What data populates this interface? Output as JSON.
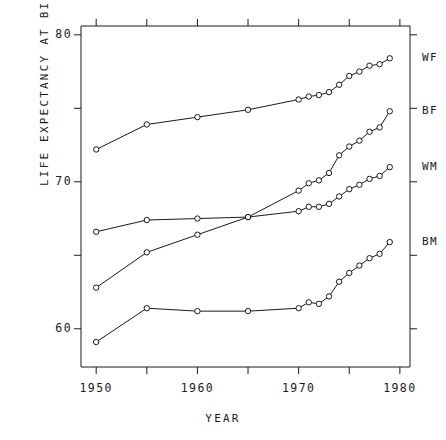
{
  "chart_data": {
    "type": "line",
    "title": "",
    "xlabel": "YEAR",
    "ylabel": "LIFE EXPECTANCY AT BIRTH (YEARS)",
    "xlim": [
      1948.5,
      1981.0
    ],
    "ylim": [
      57.4,
      80.6
    ],
    "grid": false,
    "legend_position": "right-of-axes-inline",
    "x_major_ticks": [
      1950,
      1960,
      1970,
      1980
    ],
    "x_minor_ticks": [
      1955,
      1965,
      1975
    ],
    "x_tick_labels": [
      "1950",
      "1960",
      "1970",
      "1980"
    ],
    "y_major_ticks": [
      60,
      70,
      80
    ],
    "y_minor_ticks": [
      65,
      75
    ],
    "y_tick_labels": [
      "60",
      "70",
      "80"
    ],
    "marker": "open-circle",
    "series": [
      {
        "name": "WF",
        "label": "WF",
        "color": "#1a1a1a",
        "points": [
          [
            1950,
            72.2
          ],
          [
            1955,
            73.9
          ],
          [
            1960,
            74.4
          ],
          [
            1965,
            74.9
          ],
          [
            1970,
            75.6
          ],
          [
            1971,
            75.8
          ],
          [
            1972,
            75.9
          ],
          [
            1973,
            76.1
          ],
          [
            1974,
            76.6
          ],
          [
            1975,
            77.2
          ],
          [
            1976,
            77.5
          ],
          [
            1977,
            77.9
          ],
          [
            1978,
            78.0
          ],
          [
            1979,
            78.4
          ]
        ]
      },
      {
        "name": "BF",
        "label": "BF",
        "color": "#1a1a1a",
        "points": [
          [
            1950,
            62.8
          ],
          [
            1955,
            65.2
          ],
          [
            1960,
            66.4
          ],
          [
            1965,
            67.6
          ],
          [
            1970,
            69.4
          ],
          [
            1971,
            69.9
          ],
          [
            1972,
            70.1
          ],
          [
            1973,
            70.6
          ],
          [
            1974,
            71.8
          ],
          [
            1975,
            72.4
          ],
          [
            1976,
            72.8
          ],
          [
            1977,
            73.4
          ],
          [
            1978,
            73.7
          ],
          [
            1979,
            74.8
          ]
        ]
      },
      {
        "name": "WM",
        "label": "WM",
        "color": "#1a1a1a",
        "points": [
          [
            1950,
            66.6
          ],
          [
            1955,
            67.4
          ],
          [
            1960,
            67.5
          ],
          [
            1965,
            67.6
          ],
          [
            1970,
            68.0
          ],
          [
            1971,
            68.3
          ],
          [
            1972,
            68.3
          ],
          [
            1973,
            68.5
          ],
          [
            1974,
            69.0
          ],
          [
            1975,
            69.5
          ],
          [
            1976,
            69.8
          ],
          [
            1977,
            70.2
          ],
          [
            1978,
            70.4
          ],
          [
            1979,
            71.0
          ]
        ]
      },
      {
        "name": "BM",
        "label": "BM",
        "color": "#1a1a1a",
        "points": [
          [
            1950,
            59.1
          ],
          [
            1955,
            61.4
          ],
          [
            1960,
            61.2
          ],
          [
            1965,
            61.2
          ],
          [
            1970,
            61.4
          ],
          [
            1971,
            61.8
          ],
          [
            1972,
            61.7
          ],
          [
            1973,
            62.2
          ],
          [
            1974,
            63.2
          ],
          [
            1975,
            63.8
          ],
          [
            1976,
            64.3
          ],
          [
            1977,
            64.8
          ],
          [
            1978,
            65.1
          ],
          [
            1979,
            65.9
          ]
        ]
      }
    ]
  },
  "axes": {
    "x_axis_title": "YEAR",
    "y_axis_title": "LIFE EXPECTANCY AT BIRTH (YEARS)"
  },
  "series_labels": {
    "wf": "WF",
    "bf": "BF",
    "wm": "WM",
    "bm": "BM"
  },
  "y_tick_labels": {
    "t80": "80",
    "t70": "70",
    "t60": "60"
  },
  "x_tick_labels": {
    "t1950": "1950",
    "t1960": "1960",
    "t1970": "1970",
    "t1980": "1980"
  }
}
